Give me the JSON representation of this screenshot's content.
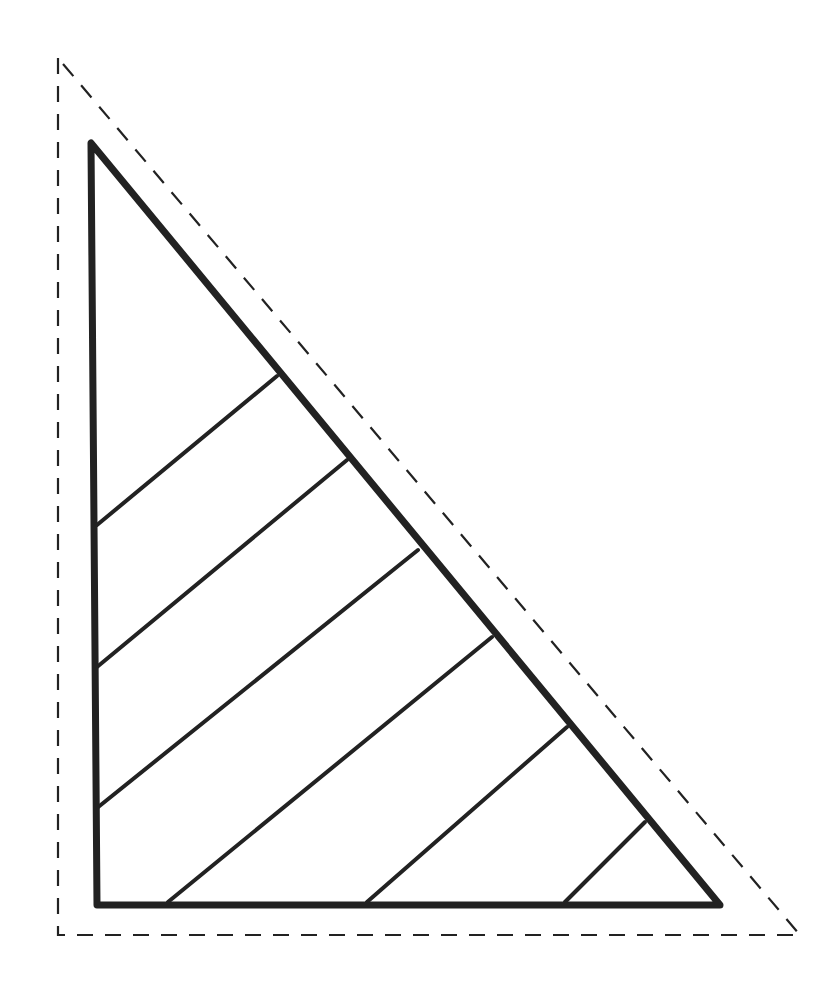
{
  "diagram": {
    "colors": {
      "background": "#ffffff",
      "stroke": "#222222"
    },
    "outer_dashed_triangle": {
      "points": [
        [
          58,
          58
        ],
        [
          58,
          935
        ],
        [
          800,
          935
        ]
      ],
      "stroke_width": 2.2,
      "dash": "16 12"
    },
    "inner_triangle": {
      "points": [
        [
          91,
          143
        ],
        [
          97,
          905
        ],
        [
          720,
          905
        ]
      ],
      "stroke_width": 7
    },
    "stripes": [
      {
        "from": [
          277,
          376
        ],
        "to": [
          97,
          525
        ]
      },
      {
        "from": [
          347,
          460
        ],
        "to": [
          97,
          667
        ]
      },
      {
        "from": [
          418,
          550
        ],
        "to": [
          97,
          808
        ]
      },
      {
        "from": [
          492,
          637
        ],
        "to": [
          168,
          902
        ]
      },
      {
        "from": [
          567,
          727
        ],
        "to": [
          367,
          902
        ]
      },
      {
        "from": [
          645,
          822
        ],
        "to": [
          565,
          902
        ]
      }
    ],
    "stripe_width": 4
  }
}
